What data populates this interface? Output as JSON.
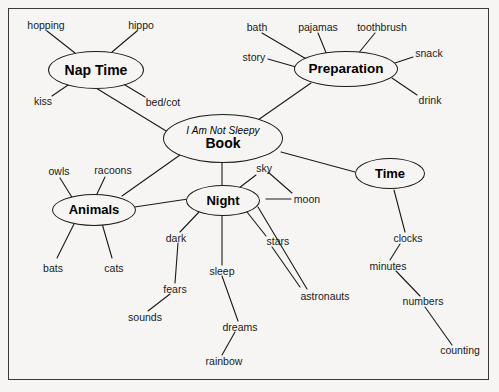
{
  "diagram": {
    "type": "mind-map",
    "background_color": "#f6f5f3",
    "line_color": "#1a1a1a",
    "central_node": {
      "subtitle": "I Am Not Sleepy",
      "title": "Book"
    },
    "branch_nodes": [
      {
        "id": "nap-time",
        "label": "Nap Time"
      },
      {
        "id": "preparation",
        "label": "Preparation"
      },
      {
        "id": "animals",
        "label": "Animals"
      },
      {
        "id": "night",
        "label": "Night"
      },
      {
        "id": "time",
        "label": "Time"
      }
    ],
    "leaves": {
      "nap_time": [
        "hopping",
        "hippo",
        "kiss",
        "bed/cot"
      ],
      "preparation": [
        "bath",
        "pajamas",
        "toothbrush",
        "story",
        "snack",
        "drink"
      ],
      "animals": [
        "owls",
        "racoons",
        "bats",
        "cats"
      ],
      "night": [
        "sky",
        "moon",
        "stars",
        "dark",
        "sleep",
        "astronauts",
        "fears",
        "sounds",
        "dreams",
        "rainbow"
      ],
      "time": [
        "clocks",
        "minutes",
        "numbers",
        "counting"
      ]
    },
    "labels": {
      "hopping": "hopping",
      "hippo": "hippo",
      "kiss": "kiss",
      "bed_cot": "bed/cot",
      "bath": "bath",
      "pajamas": "pajamas",
      "toothbrush": "toothbrush",
      "story": "story",
      "snack": "snack",
      "drink": "drink",
      "owls": "owls",
      "racoons": "racoons",
      "bats": "bats",
      "cats": "cats",
      "sky": "sky",
      "moon": "moon",
      "stars": "stars",
      "dark": "dark",
      "sleep": "sleep",
      "astronauts": "astronauts",
      "fears": "fears",
      "sounds": "sounds",
      "dreams": "dreams",
      "rainbow": "rainbow",
      "clocks": "clocks",
      "minutes": "minutes",
      "numbers": "numbers",
      "counting": "counting"
    }
  }
}
